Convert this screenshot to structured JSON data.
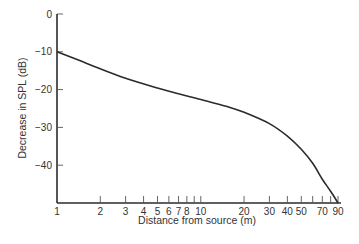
{
  "chart_data": {
    "type": "line",
    "title": "",
    "xlabel": "Distance from source (m)",
    "ylabel": "Decrease in SPL (dB)",
    "xscale": "log",
    "xlim": [
      1,
      90
    ],
    "ylim": [
      -50,
      0
    ],
    "grid": false,
    "legend": null,
    "x_ticks": [
      1,
      2,
      3,
      4,
      5,
      6,
      7,
      8,
      10,
      20,
      30,
      40,
      50,
      70,
      90
    ],
    "x_tick_labels": [
      "1",
      "2",
      "3",
      "4",
      "5",
      "6",
      "7",
      "8",
      "10",
      "20",
      "30",
      "40",
      "50",
      "70",
      "90"
    ],
    "x_minor_ticks": [
      9,
      60,
      80
    ],
    "y_ticks": [
      0,
      -10,
      -20,
      -30,
      -40
    ],
    "y_tick_labels": [
      "0",
      "-10",
      "-20",
      "-30",
      "-40"
    ],
    "series": [
      {
        "name": "SPL decrease",
        "x": [
          1,
          1.5,
          2,
          3,
          5,
          7,
          10,
          15,
          20,
          30,
          40,
          50,
          60,
          70,
          80,
          90
        ],
        "values": [
          -10,
          -12.6,
          -14.5,
          -17,
          -19.6,
          -21.1,
          -22.6,
          -24.4,
          -26,
          -29,
          -32.3,
          -35.8,
          -39.5,
          -43.7,
          -46.9,
          -50
        ]
      }
    ]
  },
  "labels": {
    "xlabel": "Distance from source (m)",
    "ylabel": "Decrease in SPL (dB)"
  }
}
